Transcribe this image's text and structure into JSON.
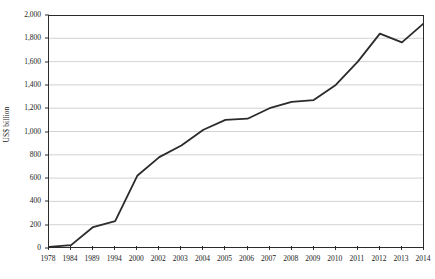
{
  "chart_data": {
    "type": "line",
    "title": "",
    "subtitle": "",
    "xlabel": "",
    "ylabel": "US$ billion",
    "categories": [
      "1978",
      "1984",
      "1989",
      "1994",
      "2000",
      "2002",
      "2003",
      "2004",
      "2005",
      "2006",
      "2007",
      "2008",
      "2009",
      "2010",
      "2011",
      "2012",
      "2013",
      "2014"
    ],
    "values": [
      10,
      25,
      180,
      230,
      620,
      780,
      880,
      1015,
      1100,
      1110,
      1200,
      1255,
      1270,
      1400,
      1600,
      1840,
      1765,
      1930
    ],
    "series": [
      {
        "name": "US$ billion",
        "values": [
          10,
          25,
          180,
          230,
          620,
          780,
          880,
          1015,
          1100,
          1110,
          1200,
          1255,
          1270,
          1400,
          1600,
          1840,
          1765,
          1930
        ]
      }
    ],
    "ylim": [
      0,
      2000
    ],
    "yticks": [
      0,
      200,
      400,
      600,
      800,
      1000,
      1200,
      1400,
      1600,
      1800,
      2000
    ],
    "ytick_labels": [
      "0",
      "200",
      "400",
      "600",
      "800",
      "1,000",
      "1,200",
      "1,400",
      "1,600",
      "1,800",
      "2,000"
    ],
    "grid": true,
    "grid_axis": "y",
    "legend": false,
    "legend_position": "none",
    "line_color": "#2b2b2b",
    "grid_color": "#c8c8c8",
    "axis_color": "#2b2b2b",
    "background_color": "#ffffff"
  }
}
